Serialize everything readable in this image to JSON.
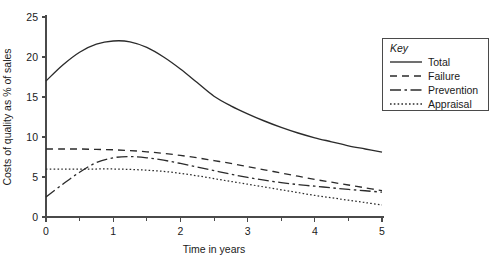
{
  "chart_data": {
    "type": "line",
    "title": "",
    "xlabel": "Time in years",
    "ylabel": "Costs of quality as % of sales",
    "xlim": [
      0,
      5
    ],
    "ylim": [
      0,
      25
    ],
    "xticks": [
      "0",
      "1",
      "2",
      "3",
      "4",
      "5"
    ],
    "yticks": [
      "0",
      "5",
      "10",
      "15",
      "20",
      "25"
    ],
    "x_minor_tick_step": 0.5,
    "grid": false,
    "legend_position": "top-right",
    "legend_title": "Key",
    "line_color": "#2b2b2b",
    "axis_color": "#4a4a4a",
    "background": "#ffffff",
    "x": [
      0,
      0.25,
      0.5,
      0.75,
      1,
      1.25,
      1.5,
      1.75,
      2,
      2.25,
      2.5,
      2.75,
      3,
      3.25,
      3.5,
      3.75,
      4,
      4.25,
      4.5,
      4.75,
      5
    ],
    "series": [
      {
        "name": "Total",
        "style": "solid",
        "values": [
          17.0,
          19.0,
          20.6,
          21.6,
          22.0,
          21.9,
          21.2,
          20.0,
          18.5,
          16.8,
          15.1,
          13.9,
          12.9,
          12.0,
          11.2,
          10.5,
          9.9,
          9.4,
          8.9,
          8.5,
          8.1
        ]
      },
      {
        "name": "Failure",
        "style": "dashed",
        "values": [
          8.5,
          8.5,
          8.5,
          8.45,
          8.4,
          8.3,
          8.15,
          7.95,
          7.7,
          7.4,
          7.05,
          6.7,
          6.3,
          5.9,
          5.5,
          5.1,
          4.7,
          4.35,
          4.0,
          3.65,
          3.3
        ]
      },
      {
        "name": "Prevention",
        "style": "dash-dot",
        "values": [
          2.5,
          4.1,
          5.6,
          6.8,
          7.4,
          7.55,
          7.4,
          7.1,
          6.7,
          6.25,
          5.8,
          5.35,
          4.95,
          4.6,
          4.3,
          4.05,
          3.85,
          3.65,
          3.45,
          3.28,
          3.1
        ]
      },
      {
        "name": "Appraisal",
        "style": "dotted",
        "values": [
          6.0,
          6.0,
          6.0,
          6.0,
          6.0,
          5.95,
          5.85,
          5.7,
          5.45,
          5.15,
          4.8,
          4.45,
          4.1,
          3.75,
          3.4,
          3.05,
          2.7,
          2.4,
          2.1,
          1.8,
          1.5
        ]
      }
    ]
  },
  "legend": {
    "title": "Key",
    "items": [
      {
        "label": "Total",
        "style": "solid"
      },
      {
        "label": "Failure",
        "style": "dashed"
      },
      {
        "label": "Prevention",
        "style": "dash-dot"
      },
      {
        "label": "Appraisal",
        "style": "dotted"
      }
    ]
  },
  "axes": {
    "x_title": "Time in years",
    "y_title": "Costs of quality as % of sales",
    "x_tick_labels": [
      "0",
      "1",
      "2",
      "3",
      "4",
      "5"
    ],
    "y_tick_labels": [
      "0",
      "5",
      "10",
      "15",
      "20",
      "25"
    ]
  }
}
